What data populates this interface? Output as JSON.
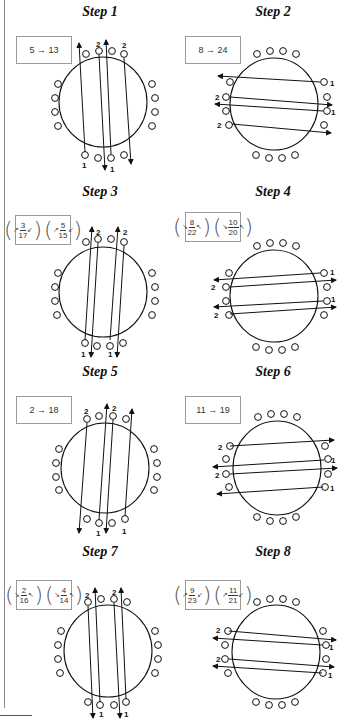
{
  "steps": [
    {
      "id": 1,
      "title": "Step 1",
      "label_type": "text",
      "label": "5 → 13",
      "orientation": "vertical",
      "lines": [
        {
          "x1": 78,
          "y1": 162,
          "x2": 72,
          "y2": 40,
          "dir": "up",
          "start_label": "1",
          "start_label_pos": [
            76,
            172
          ]
        },
        {
          "x1": 95,
          "y1": 50,
          "x2": 104,
          "y2": 168,
          "dir": "down",
          "end_label": "",
          "start_label": "2",
          "start_label_pos": [
            93,
            44
          ]
        },
        {
          "x1": 106,
          "y1": 40,
          "x2": 110,
          "y2": 168,
          "dir": "up-from-bottom",
          "start_label": "1",
          "start_label_pos": [
            111,
            172
          ]
        },
        {
          "x1": 124,
          "y1": 50,
          "x2": 131,
          "y2": 164,
          "dir": "down",
          "start_label": "2",
          "start_label_pos": [
            124,
            44
          ]
        }
      ]
    },
    {
      "id": 2,
      "title": "Step 2",
      "label_type": "text",
      "label": "8 → 24",
      "orientation": "horizontal"
    },
    {
      "id": 3,
      "title": "Step 3",
      "label_type": "fraction",
      "fractions": [
        {
          "num": "3",
          "den": "17",
          "rotation": "counterclockwise"
        },
        {
          "num": "5",
          "den": "15",
          "rotation": "counterclockwise"
        }
      ],
      "orientation": "vertical"
    },
    {
      "id": 4,
      "title": "Step 4",
      "label_type": "fraction",
      "fractions": [
        {
          "num": "8",
          "den": "22",
          "rotation": "clockwise"
        },
        {
          "num": "10",
          "den": "20",
          "rotation": "clockwise"
        }
      ],
      "orientation": "horizontal"
    },
    {
      "id": 5,
      "title": "Step 5",
      "label_type": "text",
      "label": "2 → 18",
      "orientation": "vertical"
    },
    {
      "id": 6,
      "title": "Step 6",
      "label_type": "text",
      "label": "11 → 19",
      "orientation": "horizontal"
    },
    {
      "id": 7,
      "title": "Step 7",
      "label_type": "fraction",
      "fractions": [
        {
          "num": "2",
          "den": "16",
          "rotation": "clockwise"
        },
        {
          "num": "4",
          "den": "14",
          "rotation": "clockwise"
        }
      ],
      "orientation": "vertical"
    },
    {
      "id": 8,
      "title": "Step 8",
      "label_type": "fraction",
      "fractions": [
        {
          "num": "9",
          "den": "23",
          "rotation": "counterclockwise"
        },
        {
          "num": "11",
          "den": "21",
          "rotation": "counterclockwise"
        }
      ],
      "orientation": "horizontal"
    }
  ],
  "pin_labels": {
    "one": "1",
    "two": "2"
  },
  "colors": {
    "line": "#111111",
    "box_border": "#9a9a9a",
    "rule": "#8a8a8a"
  }
}
